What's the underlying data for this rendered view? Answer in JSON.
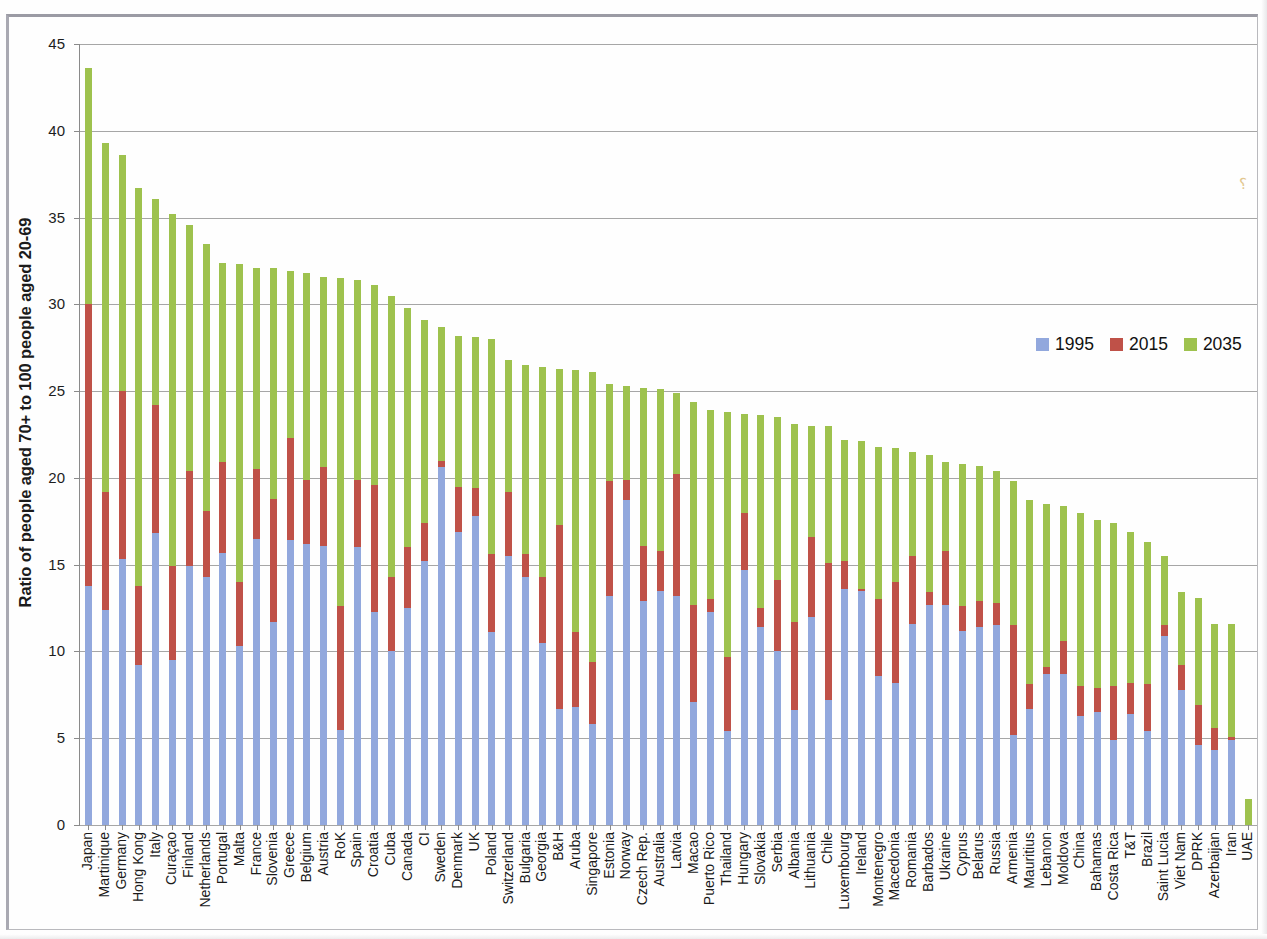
{
  "chart_data": {
    "type": "bar",
    "stacked": true,
    "title": "",
    "xlabel": "",
    "ylabel": "Ratio of people aged 70+ to 100 people aged 20-69",
    "ylim": [
      0,
      45
    ],
    "yticks": [
      0,
      5,
      10,
      15,
      20,
      25,
      30,
      35,
      40,
      45
    ],
    "grid": true,
    "legend_position": "right",
    "series_colors": {
      "1995": "#92a8dd",
      "2015": "#bf5148",
      "2035": "#9ec24e"
    },
    "legend": [
      "1995",
      "2015",
      "2035"
    ],
    "categories": [
      "Japan",
      "Martinique",
      "Germany",
      "Hong Kong",
      "Italy",
      "Curaçao",
      "Finland",
      "Netherlands",
      "Portugal",
      "Malta",
      "France",
      "Slovenia",
      "Greece",
      "Belgium",
      "Austria",
      "RoK",
      "Spain",
      "Croatia",
      "Cuba",
      "Canada",
      "CI",
      "Sweden",
      "Denmark",
      "UK",
      "Poland",
      "Switzerland",
      "Bulgaria",
      "Georgia",
      "B&H",
      "Aruba",
      "Singapore",
      "Estonia",
      "Norway",
      "Czech Rep.",
      "Australia",
      "Latvia",
      "Macao",
      "Puerto Rico",
      "Thailand",
      "Hungary",
      "Slovakia",
      "Serbia",
      "Albania",
      "Lithuania",
      "Chile",
      "Luxembourg",
      "Ireland",
      "Montenegro",
      "Macedonia",
      "Romania",
      "Barbados",
      "Ukraine",
      "Cyprus",
      "Belarus",
      "Russia",
      "Armenia",
      "Mauritius",
      "Lebanon",
      "Moldova",
      "China",
      "Bahamas",
      "Costa Rica",
      "T&T",
      "Brazil",
      "Saint Lucia",
      "Viet Nam",
      "DPRK",
      "Azerbaijan",
      "Iran",
      "UAE"
    ],
    "series": [
      {
        "name": "1995",
        "values": [
          13.8,
          12.4,
          15.3,
          9.2,
          16.8,
          9.5,
          14.9,
          14.3,
          15.7,
          10.3,
          16.5,
          11.7,
          16.4,
          16.2,
          16.1,
          5.5,
          16.0,
          12.3,
          10.0,
          12.5,
          15.2,
          20.6,
          16.9,
          17.8,
          11.1,
          15.5,
          14.3,
          10.5,
          6.7,
          6.8,
          5.8,
          13.2,
          18.7,
          12.9,
          13.5,
          13.2,
          7.1,
          12.3,
          5.4,
          14.7,
          11.4,
          10.0,
          6.6,
          12.0,
          7.2,
          13.6,
          13.5,
          8.6,
          8.2,
          11.6,
          12.7,
          12.7,
          11.2,
          11.4,
          11.5,
          5.2,
          6.7,
          8.7,
          8.7,
          6.3,
          6.5,
          4.9,
          6.4,
          5.4,
          10.9,
          7.8,
          4.6,
          4.3,
          4.9,
          0.0
        ]
      },
      {
        "name": "2015",
        "values": [
          30.0,
          19.2,
          25.0,
          13.8,
          24.2,
          14.9,
          20.4,
          18.1,
          20.9,
          14.0,
          20.5,
          18.8,
          22.3,
          19.9,
          20.6,
          12.6,
          19.9,
          19.6,
          14.3,
          16.0,
          17.4,
          21.0,
          19.5,
          19.4,
          15.6,
          19.2,
          15.6,
          14.3,
          17.3,
          11.1,
          9.4,
          19.8,
          19.9,
          16.1,
          15.8,
          20.2,
          12.7,
          13.0,
          9.7,
          18.0,
          12.5,
          14.1,
          11.7,
          16.6,
          15.1,
          15.2,
          13.6,
          13.0,
          14.0,
          15.5,
          13.4,
          15.8,
          12.6,
          12.9,
          12.8,
          11.5,
          8.1,
          9.1,
          10.6,
          8.0,
          7.9,
          8.0,
          8.2,
          8.1,
          11.5,
          9.2,
          6.9,
          5.6,
          5.1,
          0.0
        ]
      },
      {
        "name": "2035",
        "values": [
          43.6,
          39.3,
          38.6,
          36.7,
          36.1,
          35.2,
          34.6,
          33.5,
          32.4,
          32.3,
          32.1,
          32.1,
          31.9,
          31.8,
          31.6,
          31.5,
          31.4,
          31.1,
          30.5,
          29.8,
          29.1,
          28.7,
          28.2,
          28.1,
          28.0,
          26.8,
          26.5,
          26.4,
          26.3,
          26.2,
          26.1,
          25.4,
          25.3,
          25.2,
          25.1,
          24.9,
          24.4,
          23.9,
          23.8,
          23.7,
          23.6,
          23.5,
          23.1,
          23.0,
          23.0,
          22.2,
          22.1,
          21.8,
          21.7,
          21.5,
          21.3,
          20.9,
          20.8,
          20.7,
          20.4,
          19.8,
          18.7,
          18.5,
          18.4,
          18.0,
          17.6,
          17.4,
          16.9,
          16.3,
          15.5,
          13.4,
          13.1,
          11.6,
          11.6,
          1.5
        ]
      }
    ]
  },
  "legend": {
    "items": [
      {
        "label": "1995",
        "color": "#92a8dd"
      },
      {
        "label": "2015",
        "color": "#bf5148"
      },
      {
        "label": "2035",
        "color": "#9ec24e"
      }
    ]
  },
  "axis": {
    "y_title": "Ratio of people aged 70+ to 100 people aged 20-69",
    "y_ticks": [
      "45",
      "40",
      "35",
      "30",
      "25",
      "20",
      "15",
      "10",
      "5",
      "0"
    ]
  },
  "artifacts": {
    "smudge_glyph": "⸮"
  }
}
